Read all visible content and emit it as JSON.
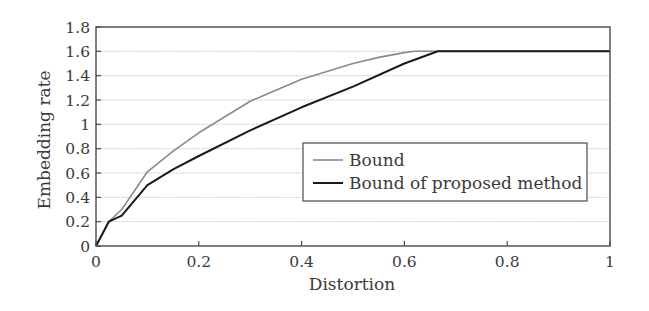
{
  "chart_data": {
    "type": "line",
    "title": "",
    "xlabel": "Distortion",
    "ylabel": "Embedding rate",
    "xlim": [
      0,
      1
    ],
    "ylim": [
      0,
      1.8
    ],
    "xticks": [
      0,
      0.2,
      0.4,
      0.6,
      0.8,
      1
    ],
    "xtick_labels": [
      "0",
      "0.2",
      "0.4",
      "0.6",
      "0.8",
      "1"
    ],
    "yticks": [
      0,
      0.2,
      0.4,
      0.6,
      0.8,
      1,
      1.2,
      1.4,
      1.6,
      1.8
    ],
    "ytick_labels": [
      "0",
      "0.2",
      "0.4",
      "0.6",
      "0.8",
      "1",
      "1.2",
      "1.4",
      "1.6",
      "1.8"
    ],
    "grid": "horizontal dotted",
    "legend_position": "center-right",
    "series": [
      {
        "name": "Bound",
        "color": "#8a8a8a",
        "x": [
          0,
          0.025,
          0.05,
          0.1,
          0.15,
          0.2,
          0.3,
          0.4,
          0.5,
          0.55,
          0.6,
          0.62,
          0.7,
          0.8,
          0.9,
          1.0
        ],
        "y": [
          0,
          0.2,
          0.3,
          0.61,
          0.78,
          0.93,
          1.19,
          1.37,
          1.5,
          1.55,
          1.59,
          1.6,
          1.6,
          1.6,
          1.6,
          1.6
        ]
      },
      {
        "name": "Bound of proposed method",
        "color": "#1a1a1a",
        "x": [
          0,
          0.025,
          0.05,
          0.1,
          0.15,
          0.2,
          0.3,
          0.4,
          0.5,
          0.6,
          0.665,
          0.7,
          0.8,
          0.9,
          1.0
        ],
        "y": [
          0,
          0.2,
          0.25,
          0.5,
          0.63,
          0.74,
          0.95,
          1.14,
          1.31,
          1.5,
          1.6,
          1.6,
          1.6,
          1.6,
          1.6
        ]
      }
    ]
  }
}
